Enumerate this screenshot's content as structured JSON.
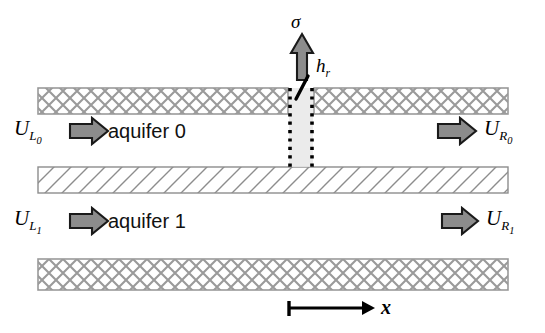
{
  "figure": {
    "background_color": "#ffffff",
    "line_color": "#000000",
    "hatch_color": "#9a9a9a",
    "arrow_fill": "#8c8c8c",
    "arrow_stroke": "#1a1a1a",
    "well_fill": "#e3e3e3"
  },
  "layers": [
    {
      "name": "top-confining-layer",
      "pattern": "cross-hatch",
      "x": 38,
      "y": 88,
      "width": 470,
      "height": 26
    },
    {
      "name": "aquitard-layer",
      "pattern": "diagonal-hatch",
      "x": 38,
      "y": 167,
      "width": 470,
      "height": 26
    },
    {
      "name": "bottom-confining-layer",
      "pattern": "cross-hatch",
      "x": 38,
      "y": 259,
      "width": 470,
      "height": 31
    }
  ],
  "aquifers": [
    {
      "label": "aquifer 0",
      "x": 108,
      "y": 131
    },
    {
      "label": "aquifer 1",
      "x": 108,
      "y": 221
    }
  ],
  "flux_arrows": [
    {
      "name": "inflow-aquifer-0",
      "label_main": "U",
      "label_sub": "L",
      "label_subsub": "0",
      "side": "left",
      "label_x": 14,
      "label_y": 126,
      "arrow_x": 72,
      "arrow_y": 131
    },
    {
      "name": "outflow-aquifer-0",
      "label_main": "U",
      "label_sub": "R",
      "label_subsub": "0",
      "side": "right",
      "label_x": 494,
      "label_y": 126,
      "arrow_x": 440,
      "arrow_y": 131
    },
    {
      "name": "inflow-aquifer-1",
      "label_main": "U",
      "label_sub": "L",
      "label_subsub": "1",
      "side": "left",
      "label_x": 14,
      "label_y": 216,
      "arrow_x": 72,
      "arrow_y": 221
    },
    {
      "name": "outflow-aquifer-1",
      "label_main": "U",
      "label_sub": "R",
      "label_subsub": "1",
      "side": "right",
      "label_x": 494,
      "label_y": 216,
      "arrow_x": 440,
      "arrow_y": 221
    }
  ],
  "well": {
    "name": "recharge-well",
    "x": 288,
    "y": 88,
    "width": 26,
    "height": 79,
    "dot_color": "#000000",
    "fill_color": "#e3e3e3"
  },
  "annotations": {
    "sigma": {
      "symbol": "σ",
      "x": 294,
      "y": 13
    },
    "head_symbol": {
      "main": "h",
      "sub": "r",
      "x": 316,
      "y": 58
    },
    "axis": {
      "label": "x",
      "label_x": 379,
      "label_y": 297
    }
  },
  "vertical_arrow": {
    "name": "recharge-flux-arrow",
    "x": 292,
    "y": 36,
    "width": 20,
    "height": 40,
    "direction": "up"
  },
  "axis_indicator": {
    "name": "x-axis-indicator",
    "origin_x": 288,
    "y": 308,
    "end_x": 372
  }
}
